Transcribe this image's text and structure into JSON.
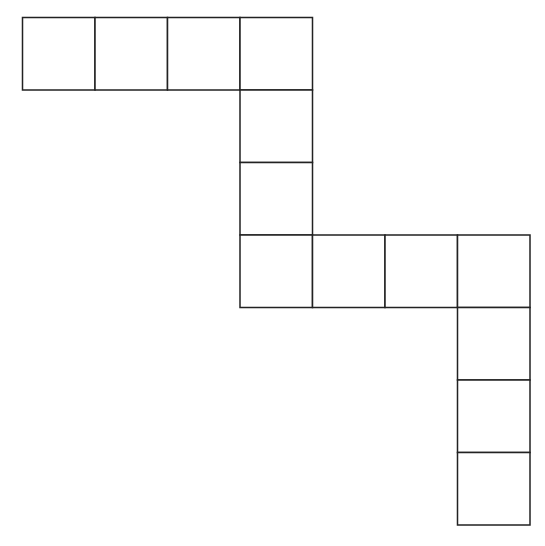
{
  "diagram": {
    "type": "square-grid-net",
    "cell_count": 14,
    "stroke_color": "#222222",
    "fill_color": "#ffffff",
    "cells": [
      {
        "row": 0,
        "col": 0
      },
      {
        "row": 0,
        "col": 1
      },
      {
        "row": 0,
        "col": 2
      },
      {
        "row": 0,
        "col": 3
      },
      {
        "row": 1,
        "col": 3
      },
      {
        "row": 2,
        "col": 3
      },
      {
        "row": 3,
        "col": 3
      },
      {
        "row": 3,
        "col": 4
      },
      {
        "row": 3,
        "col": 5
      },
      {
        "row": 3,
        "col": 6
      },
      {
        "row": 4,
        "col": 6
      },
      {
        "row": 5,
        "col": 6
      },
      {
        "row": 6,
        "col": 6
      }
    ]
  }
}
